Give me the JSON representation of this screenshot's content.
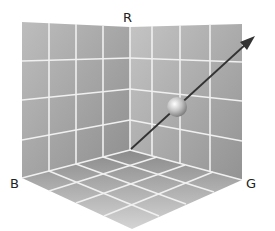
{
  "diagram": {
    "axes": {
      "r": "R",
      "g": "G",
      "b": "B"
    },
    "grid_divisions": 4,
    "elements": [
      "left wall",
      "right wall",
      "floor",
      "vector arrow",
      "sphere"
    ],
    "colors": {
      "wall": "#a9a9a9",
      "grid": "#f2f2f2",
      "arrow": "#333333",
      "sphere": "#c8c8c8"
    }
  }
}
